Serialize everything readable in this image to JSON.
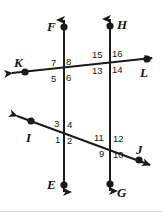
{
  "figure": {
    "canvas": {
      "width": 162,
      "height": 212
    },
    "stroke_color": "#1a1a1a",
    "background": "#ffffff",
    "point_labels": [
      {
        "id": "F",
        "text": "F",
        "x": 47,
        "y": 20,
        "dot_x": 64,
        "dot_y": 27
      },
      {
        "id": "H",
        "text": "H",
        "x": 117,
        "y": 18,
        "dot_x": 110,
        "dot_y": 26
      },
      {
        "id": "K",
        "text": "K",
        "x": 14,
        "y": 56,
        "dot_x": 25,
        "dot_y": 72
      },
      {
        "id": "L",
        "text": "L",
        "x": 140,
        "y": 66,
        "dot_x": 147,
        "dot_y": 58
      },
      {
        "id": "I",
        "text": "I",
        "x": 26,
        "y": 131,
        "dot_x": 31,
        "dot_y": 121
      },
      {
        "id": "J",
        "text": "J",
        "x": 136,
        "y": 143,
        "dot_x": 139,
        "dot_y": 160
      },
      {
        "id": "E",
        "text": "E",
        "x": 47,
        "y": 178,
        "dot_x": 64,
        "dot_y": 185
      },
      {
        "id": "G",
        "text": "G",
        "x": 117,
        "y": 186,
        "dot_x": 110,
        "dot_y": 184
      }
    ],
    "angle_numbers": [
      {
        "id": "a7",
        "text": "7",
        "x": 51,
        "y": 58
      },
      {
        "id": "a8",
        "text": "8",
        "x": 66,
        "y": 57
      },
      {
        "id": "a5",
        "text": "5",
        "x": 51,
        "y": 74
      },
      {
        "id": "a6",
        "text": "6",
        "x": 66,
        "y": 73
      },
      {
        "id": "a15",
        "text": "15",
        "x": 92,
        "y": 50
      },
      {
        "id": "a16",
        "text": "16",
        "x": 112,
        "y": 49
      },
      {
        "id": "a13",
        "text": "13",
        "x": 92,
        "y": 66
      },
      {
        "id": "a14",
        "text": "14",
        "x": 112,
        "y": 65
      },
      {
        "id": "a3",
        "text": "3",
        "x": 54,
        "y": 119
      },
      {
        "id": "a4",
        "text": "4",
        "x": 67,
        "y": 120
      },
      {
        "id": "a1",
        "text": "1",
        "x": 55,
        "y": 135
      },
      {
        "id": "a2",
        "text": "2",
        "x": 67,
        "y": 136
      },
      {
        "id": "a11",
        "text": "11",
        "x": 94,
        "y": 133
      },
      {
        "id": "a12",
        "text": "12",
        "x": 113,
        "y": 134
      },
      {
        "id": "a9",
        "text": "9",
        "x": 99,
        "y": 149
      },
      {
        "id": "a10",
        "text": "10",
        "x": 113,
        "y": 150
      }
    ],
    "lines": [
      {
        "id": "line-FE",
        "name": "vertical-left-line",
        "x1": 64,
        "y1": 14,
        "x2": 64,
        "y2": 198,
        "orientation": "vertical"
      },
      {
        "id": "line-HG",
        "name": "vertical-right-line",
        "x1": 110,
        "y1": 13,
        "x2": 110,
        "y2": 197,
        "orientation": "vertical"
      },
      {
        "id": "line-KL",
        "name": "upper-transversal",
        "x1": 6,
        "y1": 74,
        "x2": 158,
        "y2": 57,
        "orientation": "transversal"
      },
      {
        "id": "line-IJ",
        "name": "lower-transversal",
        "x1": 11,
        "y1": 114,
        "x2": 155,
        "y2": 167,
        "orientation": "transversal"
      }
    ],
    "intersections": [
      {
        "id": "int-upper-left",
        "x": 64,
        "y": 67,
        "angles": [
          "7",
          "8",
          "5",
          "6"
        ]
      },
      {
        "id": "int-upper-right",
        "x": 110,
        "y": 62,
        "angles": [
          "15",
          "16",
          "13",
          "14"
        ]
      },
      {
        "id": "int-lower-left",
        "x": 64,
        "y": 133,
        "angles": [
          "3",
          "4",
          "1",
          "2"
        ]
      },
      {
        "id": "int-lower-right",
        "x": 110,
        "y": 150,
        "angles": [
          "11",
          "12",
          "9",
          "10"
        ]
      }
    ]
  }
}
